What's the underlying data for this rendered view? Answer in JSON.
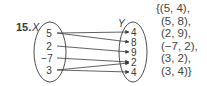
{
  "problem": {
    "number": "15.",
    "domain_label": "X",
    "range_label": "Y",
    "domain_values": [
      "5",
      "2",
      "−7",
      "3"
    ],
    "range_values": [
      "4",
      "8",
      "9",
      "2",
      "4"
    ],
    "mappings": [
      {
        "from": 0,
        "to": 0
      },
      {
        "from": 0,
        "to": 1
      },
      {
        "from": 1,
        "to": 2
      },
      {
        "from": 2,
        "to": 3
      },
      {
        "from": 3,
        "to": 3
      },
      {
        "from": 3,
        "to": 4
      }
    ],
    "ordered_pairs": [
      "{(5, 4),",
      "(5, 8),",
      "(2, 9),",
      "(−7, 2),",
      "(3, 2),",
      "(3, 4)}"
    ]
  },
  "colors": {
    "ink": "#3a3a3a"
  }
}
